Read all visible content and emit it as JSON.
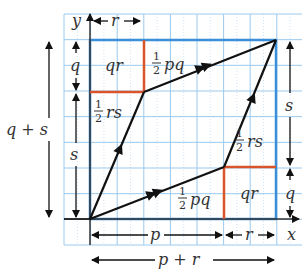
{
  "diagram": {
    "colors": {
      "grid": "#9cc9ee",
      "box": "#3a8fd8",
      "red": "#d9532b",
      "ink": "#111111",
      "text": "#333333"
    },
    "axes": {
      "x_label": "x",
      "y_label": "y"
    },
    "regions": {
      "top_left_rect": "qr",
      "top_triangle_half": "1",
      "top_triangle_den": "2",
      "top_triangle_var": "pq",
      "left_triangle_half": "1",
      "left_triangle_den": "2",
      "left_triangle_var": "rs",
      "right_triangle_half": "1",
      "right_triangle_den": "2",
      "right_triangle_var": "rs",
      "bottom_triangle_half": "1",
      "bottom_triangle_den": "2",
      "bottom_triangle_var": "pq",
      "bottom_right_rect": "qr"
    },
    "dimensions": {
      "top_r": "r",
      "left_q": "q",
      "left_s": "s",
      "left_q_plus_s": "q + s",
      "right_s": "s",
      "right_q": "q",
      "bottom_p": "p",
      "bottom_r": "r",
      "bottom_p_plus_r": "p + r"
    }
  }
}
